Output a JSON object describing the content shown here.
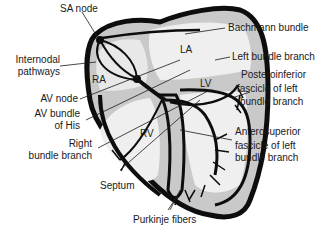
{
  "diagram": {
    "chambers": {
      "ra": "RA",
      "la": "LA",
      "rv": "RV",
      "lv": "LV"
    },
    "labels": {
      "sa_node": "SA node",
      "internodal_1": "Internodal",
      "internodal_2": "pathways",
      "av_node": "AV node",
      "av_bundle_1": "AV bundle",
      "av_bundle_2": "of His",
      "right_bundle_1": "Right",
      "right_bundle_2": "bundle branch",
      "septum": "Septum",
      "purkinje": "Purkinje fibers",
      "bachmann": "Bachmann bundle",
      "left_bundle": "Left bundle branch",
      "posteroinferior_1": "Posteroinferior",
      "posteroinferior_2": "fascicle of left",
      "posteroinferior_3": "bundle branch",
      "anterosuperior_1": "Anterosuperior",
      "anterosuperior_2": "fascicle of left",
      "anterosuperior_3": "bundle branch"
    },
    "colors": {
      "outline": "#0d0d0d",
      "shade": "#c9c9c9",
      "fill": "#f2f2f2",
      "text": "#1a1a1a"
    }
  }
}
